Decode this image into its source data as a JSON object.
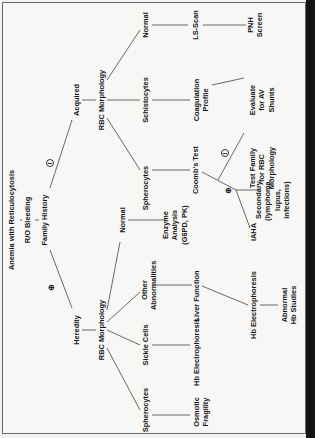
{
  "diagram": {
    "root": "Anemia with Reticulocytosis",
    "step1": "R/O Bleeding",
    "step2": "Family History",
    "branch_negative_symbol": "⊖",
    "branch_positive_symbol": "⊕",
    "acquired": {
      "label": "Acquired",
      "rbc_morphology": "RBC Morphology",
      "normal": "Normal",
      "ls_scan": "LS-Scan",
      "pnh_screen": "PNH Screen",
      "schistocytes": "Schistocytes",
      "coagulation_profile": "Coagulation Profile",
      "evaluate_av_shunts": "Evaluate for AV Shunts",
      "spherocytes": "Spherocytes",
      "coombs_test": "Coomb's Test",
      "coombs_negative": "Test Family for RBC Morphology",
      "coombs_positive_secondary": "Secondary (lymphoma, lupus, infections)",
      "coombs_positive_iaha": "IAHA"
    },
    "heredity": {
      "label": "Heredity",
      "rbc_morphology": "RBC Morphology",
      "normal": "Normal",
      "enzyme_analysis": "Enzyme Analysis (G6PD, PK)",
      "other_abnormalities": "Other Abnormalities",
      "liver_function": "Liver Function",
      "hb_electrophoresis_2": "Hb Electrophoresis",
      "abnormal_hb_studies": "Abnormal Hb Studies",
      "sickle_cells": "Sickle Cells",
      "hb_electrophoresis": "Hb Electrophoresis",
      "spherocytes": "Spherocytes",
      "osmotic_fragility": "Osmotic Fragility"
    }
  }
}
